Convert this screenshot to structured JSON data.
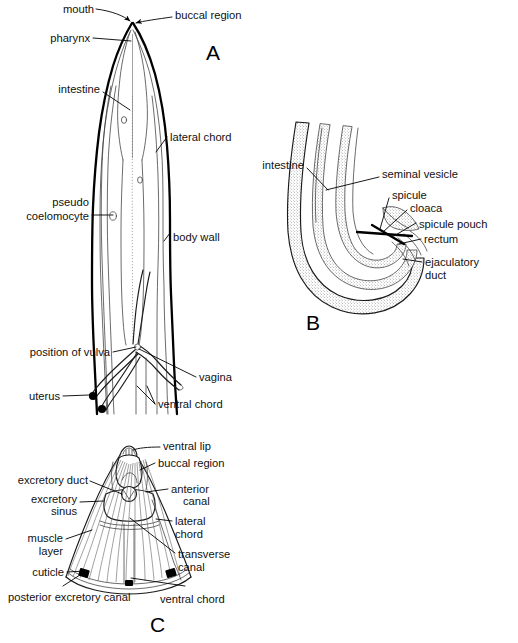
{
  "figure": {
    "background_color": "#ffffff",
    "ink_color": "#000000",
    "width": 518,
    "height": 643
  },
  "panels": [
    {
      "id": "A",
      "letter": "A",
      "caption": "Female anterior region, longitudinal section",
      "labels": [
        {
          "name": "mouth",
          "text": "mouth"
        },
        {
          "name": "buccal-region",
          "text": "buccal region"
        },
        {
          "name": "pharynx",
          "text": "pharynx"
        },
        {
          "name": "intestine",
          "text": "intestine"
        },
        {
          "name": "lateral-chord",
          "text": "lateral chord"
        },
        {
          "name": "pseudo",
          "text": "pseudo"
        },
        {
          "name": "coelomocyte",
          "text": "coelomocyte"
        },
        {
          "name": "body-wall",
          "text": "body wall"
        },
        {
          "name": "position-of-vulva",
          "text": "position of vulva"
        },
        {
          "name": "vagina",
          "text": "vagina"
        },
        {
          "name": "uterus",
          "text": "uterus"
        },
        {
          "name": "ventral-chord",
          "text": "ventral chord"
        }
      ]
    },
    {
      "id": "B",
      "letter": "B",
      "caption": "Male posterior region, longitudinal section",
      "labels": [
        {
          "name": "intestine",
          "text": "intestine"
        },
        {
          "name": "seminal-vesicle",
          "text": "seminal vesicle"
        },
        {
          "name": "spicule",
          "text": "spicule"
        },
        {
          "name": "cloaca",
          "text": "cloaca"
        },
        {
          "name": "spicule-pouch",
          "text": "spicule pouch"
        },
        {
          "name": "rectum",
          "text": "rectum"
        },
        {
          "name": "ejaculatory",
          "text": "ejaculatory"
        },
        {
          "name": "duct",
          "text": "duct"
        }
      ]
    },
    {
      "id": "C",
      "letter": "C",
      "caption": "Anterior end, excretory system, cutaway view",
      "labels": [
        {
          "name": "ventral-lip",
          "text": "ventral lip"
        },
        {
          "name": "buccal-region",
          "text": "buccal region"
        },
        {
          "name": "excretory-duct",
          "text": "excretory duct"
        },
        {
          "name": "anterior",
          "text": "anterior"
        },
        {
          "name": "canal-anterior",
          "text": "canal"
        },
        {
          "name": "excretory",
          "text": "excretory"
        },
        {
          "name": "sinus",
          "text": "sinus"
        },
        {
          "name": "lateral",
          "text": "lateral"
        },
        {
          "name": "chord",
          "text": "chord"
        },
        {
          "name": "muscle",
          "text": "muscle"
        },
        {
          "name": "layer",
          "text": "layer"
        },
        {
          "name": "transverse",
          "text": "transverse"
        },
        {
          "name": "canal-transverse",
          "text": "canal"
        },
        {
          "name": "cuticle",
          "text": "cuticle"
        },
        {
          "name": "posterior-excretory-canal",
          "text": "posterior excretory canal"
        },
        {
          "name": "ventral-chord",
          "text": "ventral chord"
        }
      ]
    }
  ]
}
